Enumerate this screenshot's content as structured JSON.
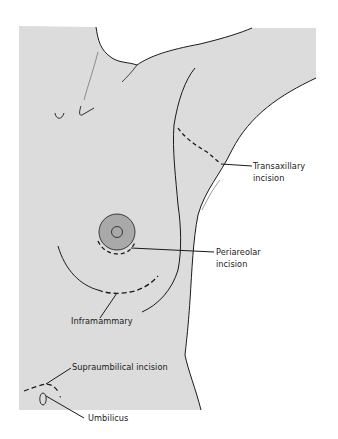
{
  "figure": {
    "colors": {
      "background": "#ffffff",
      "skin_fill": "#dcdcdc",
      "outline": "#1a1a1a",
      "areola_fill": "#a9a9a9"
    }
  },
  "labels": {
    "transaxillary": {
      "line1": "Transaxillary",
      "line2": "incision"
    },
    "periareolar": {
      "line1": "Periareolar",
      "line2": "incision"
    },
    "inframammary": {
      "line1": "Inframammary"
    },
    "supraumbilical": {
      "line1": "Supraumbilical incision"
    },
    "umbilicus": {
      "line1": "Umbilicus"
    }
  }
}
